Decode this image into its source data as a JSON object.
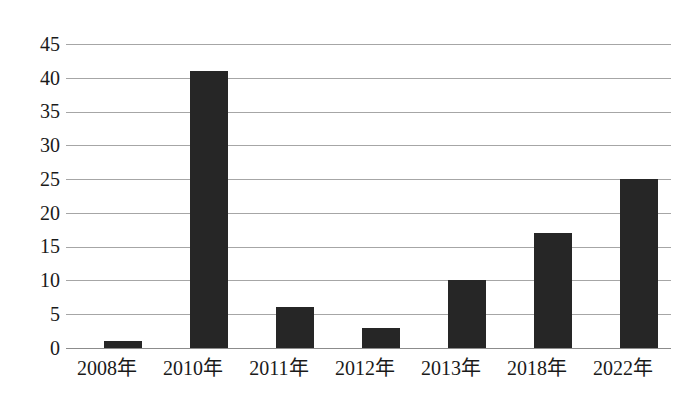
{
  "chart_data": {
    "type": "bar",
    "title": "",
    "subtitle": "",
    "xlabel": "",
    "ylabel": "",
    "categories": [
      "2008年",
      "2010年",
      "2011年",
      "2012年",
      "2013年",
      "2018年",
      "2022年"
    ],
    "values": [
      1,
      41,
      6,
      3,
      10,
      17,
      25
    ],
    "ylim": [
      0,
      45
    ],
    "ytick_labels": [
      "45",
      "40",
      "35",
      "30",
      "25",
      "20",
      "15",
      "10",
      "5",
      "0"
    ],
    "ytick_values": [
      45,
      40,
      35,
      30,
      25,
      20,
      15,
      10,
      5,
      0
    ],
    "grid": true,
    "legend": false,
    "legend_position": "none",
    "colors": {
      "bar": "#262626",
      "gridline": "#a6a6a6",
      "axis": "#8c8c8c",
      "text": "#1a1a1a",
      "background": "#ffffff"
    }
  }
}
